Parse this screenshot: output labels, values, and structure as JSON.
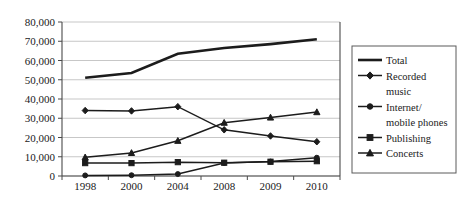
{
  "chart_data": {
    "type": "line",
    "title": "",
    "xlabel": "",
    "ylabel": "",
    "categories": [
      "1998",
      "2000",
      "2004",
      "2008",
      "2009",
      "2010"
    ],
    "ylim": [
      0,
      80000
    ],
    "ytick_labels": [
      "80,000",
      "70,000",
      "60,000",
      "50,000",
      "40,000",
      "30,000",
      "20,000",
      "10,000",
      "0"
    ],
    "ytick_values": [
      80000,
      70000,
      60000,
      50000,
      40000,
      30000,
      20000,
      10000,
      0
    ],
    "grid": true,
    "legend_position": "right",
    "series": [
      {
        "name": "Total",
        "marker": "none",
        "values": [
          51000,
          53500,
          63500,
          66500,
          68500,
          71000
        ]
      },
      {
        "name": "Recorded music",
        "marker": "diamond",
        "values": [
          34000,
          33800,
          36000,
          24000,
          20800,
          17800
        ]
      },
      {
        "name": "Internet/mobile phones",
        "marker": "circle",
        "values": [
          300,
          400,
          1000,
          6800,
          7500,
          9500
        ]
      },
      {
        "name": "Publishing",
        "marker": "square",
        "values": [
          6700,
          6700,
          7200,
          6900,
          7400,
          7700
        ]
      },
      {
        "name": "Concerts",
        "marker": "triangle",
        "values": [
          9700,
          12000,
          18300,
          27700,
          30400,
          33200
        ]
      }
    ]
  },
  "legend": {
    "entries": [
      {
        "label": "Total"
      },
      {
        "label": "Recorded"
      },
      {
        "label": "music"
      },
      {
        "label": "Internet/"
      },
      {
        "label": "mobile phones"
      },
      {
        "label": "Publishing"
      },
      {
        "label": "Concerts"
      }
    ]
  },
  "colors": {
    "line": "#1c1c1c",
    "grid": "#b9b9b9",
    "axis": "#4a4a4a",
    "text": "#1a1a1a",
    "background": "#ffffff"
  }
}
